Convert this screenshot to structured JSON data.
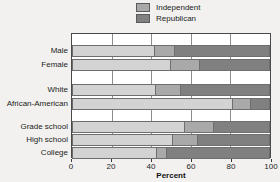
{
  "legend": {
    "position": "top-center",
    "entries": [
      {
        "label": "Independent",
        "color": "#a9a9a9",
        "swatch_name": "legend-swatch-independent"
      },
      {
        "label": "Republican",
        "color": "#808080",
        "swatch_name": "legend-swatch-republican"
      }
    ]
  },
  "axis": {
    "x_title": "Percent",
    "x_ticks": [
      "0",
      "20",
      "40",
      "60",
      "80",
      "100"
    ],
    "x_tick_values": [
      0,
      20,
      40,
      60,
      80,
      100
    ]
  },
  "colors": {
    "democrat": "#d3d3d3",
    "independent": "#a9a9a9",
    "republican": "#808080",
    "frame": "#4a4a4a",
    "grid": "#8d8d8d",
    "background": "#f2f1ef"
  },
  "chart_data": {
    "type": "bar",
    "orientation": "horizontal",
    "stacked": true,
    "stack_total": 100,
    "title": "",
    "xlabel": "Percent",
    "ylabel": "",
    "xlim": [
      0,
      100
    ],
    "grid": true,
    "legend_position": "top-center",
    "categories": [
      "Male",
      "Female",
      "White",
      "African-American",
      "Grade school",
      "High school",
      "College"
    ],
    "groups": [
      {
        "name": "Gender",
        "categories": [
          "Male",
          "Female"
        ]
      },
      {
        "name": "Race",
        "categories": [
          "White",
          "African-American"
        ]
      },
      {
        "name": "Education",
        "categories": [
          "Grade school",
          "High school",
          "College"
        ]
      }
    ],
    "series": [
      {
        "name": "Democrat",
        "color": "#d3d3d3",
        "in_legend": false,
        "values": [
          42,
          50,
          42.5,
          81.5,
          57,
          51,
          43
        ]
      },
      {
        "name": "Independent",
        "color": "#a9a9a9",
        "in_legend": true,
        "values": [
          10,
          14.5,
          12.5,
          9,
          14.5,
          12.5,
          5
        ]
      },
      {
        "name": "Republican",
        "color": "#808080",
        "in_legend": true,
        "values": [
          48,
          35.5,
          45,
          9.5,
          28.5,
          36.5,
          52
        ]
      }
    ],
    "rows": [
      {
        "category": "Male",
        "top": 11,
        "democrat": 42,
        "independent": 10,
        "republican": 48
      },
      {
        "category": "Female",
        "top": 25,
        "democrat": 50,
        "independent": 14.5,
        "republican": 35.5
      },
      {
        "category": "White",
        "top": 50,
        "democrat": 42.5,
        "independent": 12.5,
        "republican": 45
      },
      {
        "category": "African-American",
        "top": 64,
        "democrat": 81.5,
        "independent": 9,
        "republican": 9.5
      },
      {
        "category": "Grade school",
        "top": 87,
        "democrat": 57,
        "independent": 14.5,
        "republican": 28.5
      },
      {
        "category": "High school",
        "top": 100,
        "democrat": 51,
        "independent": 12.5,
        "republican": 36.5
      },
      {
        "category": "College",
        "top": 113,
        "democrat": 43,
        "independent": 5,
        "republican": 52
      }
    ]
  }
}
